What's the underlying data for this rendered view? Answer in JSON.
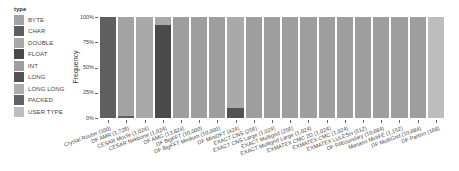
{
  "legend": {
    "title": "type",
    "items": [
      {
        "label": "BYTE",
        "color": "#a3a3a3"
      },
      {
        "label": "CHAR",
        "color": "#5f5f5f"
      },
      {
        "label": "DOUBLE",
        "color": "#a9a9a9"
      },
      {
        "label": "FLOAT",
        "color": "#4a4a4a"
      },
      {
        "label": "INT",
        "color": "#9e9e9e"
      },
      {
        "label": "LONG",
        "color": "#525252"
      },
      {
        "label": "LONG LONG",
        "color": "#adadad"
      },
      {
        "label": "PACKED",
        "color": "#636363"
      },
      {
        "label": "USER TYPE",
        "color": "#bdbdbd"
      }
    ]
  },
  "axis": {
    "ylabel": "Frequency",
    "yticks": [
      "100%",
      "75%",
      "50%",
      "25%",
      "0%"
    ]
  },
  "chart_data": {
    "type": "bar",
    "stacked": true,
    "normalized": true,
    "title": "",
    "xlabel": "",
    "ylabel": "Frequency",
    "ylim": [
      0,
      100
    ],
    "legend_title": "type",
    "legend_position": "left",
    "grid": false,
    "categories": [
      "Crystal Router (100)",
      "DF AMR (1,728)",
      "CESAR Mocfe (1,024)",
      "CESAR Nekbone (1,024)",
      "DF AMG (13,824)",
      "DF BigFFT (10,000)",
      "DF BigFFT Medium (10,000)",
      "DF MiniDFT (424)",
      "EXACT CNS (256)",
      "EXACT CNS Large (1,024)",
      "EXACT Multigrid (256)",
      "EXACT Multigrid Large (1,024)",
      "EXMATEX CMC 2D (1,024)",
      "EXMATEX CMC (1,024)",
      "EXMATEX LULESH (512)",
      "DF Fillboundary (10,684)",
      "Mariano MiniFE (1,152)",
      "DF MultiGrid (10,684)",
      "DF Partisn (168)"
    ],
    "bars": [
      [
        {
          "type": "CHAR",
          "value": 100
        }
      ],
      [
        {
          "type": "CHAR",
          "value": 2
        },
        {
          "type": "BYTE",
          "value": 98
        }
      ],
      [
        {
          "type": "DOUBLE",
          "value": 100
        }
      ],
      [
        {
          "type": "FLOAT",
          "value": 92
        },
        {
          "type": "DOUBLE",
          "value": 8
        }
      ],
      [
        {
          "type": "INT",
          "value": 100
        }
      ],
      [
        {
          "type": "INT",
          "value": 100
        }
      ],
      [
        {
          "type": "INT",
          "value": 100
        }
      ],
      [
        {
          "type": "LONG",
          "value": 10
        },
        {
          "type": "DOUBLE",
          "value": 90
        }
      ],
      [
        {
          "type": "INT",
          "value": 100
        }
      ],
      [
        {
          "type": "INT",
          "value": 100
        }
      ],
      [
        {
          "type": "INT",
          "value": 100
        }
      ],
      [
        {
          "type": "INT",
          "value": 100
        }
      ],
      [
        {
          "type": "INT",
          "value": 100
        }
      ],
      [
        {
          "type": "INT",
          "value": 100
        }
      ],
      [
        {
          "type": "INT",
          "value": 100
        }
      ],
      [
        {
          "type": "INT",
          "value": 100
        }
      ],
      [
        {
          "type": "INT",
          "value": 100
        }
      ],
      [
        {
          "type": "INT",
          "value": 100
        }
      ],
      [
        {
          "type": "USER TYPE",
          "value": 100
        }
      ]
    ]
  }
}
